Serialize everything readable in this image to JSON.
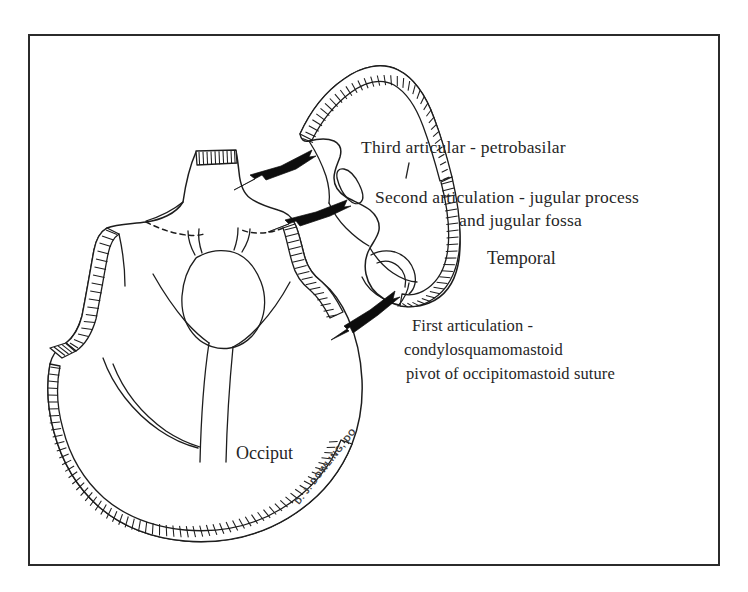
{
  "figure": {
    "frame": {
      "border_color": "#2b2b2b",
      "background_color": "#ffffff"
    },
    "ink_color": "#1d1d1d"
  },
  "annotations": {
    "third": {
      "line1": "Third articular - petrobasilar"
    },
    "second": {
      "line1": "Second articulation - jugular process",
      "line2": "and jugular fossa"
    },
    "first": {
      "line1": "First articulation -",
      "line2": "condylosquamomastoid",
      "line3": "pivot of occipitomastoid suture"
    }
  },
  "region_labels": {
    "temporal": "Temporal",
    "occiput": "Occiput"
  },
  "signature": {
    "text": "D. J. DOWLING, DO"
  },
  "arrows": [
    {
      "name": "third-articular-arrow",
      "label_ref": "third"
    },
    {
      "name": "second-articulation-arrow",
      "label_ref": "second"
    },
    {
      "name": "first-articulation-arrow",
      "label_ref": "first"
    }
  ]
}
